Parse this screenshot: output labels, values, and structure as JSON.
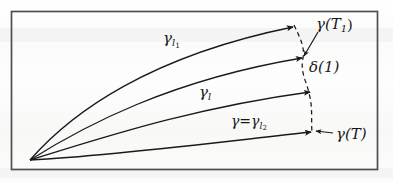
{
  "figure": {
    "type": "geometric-diagram",
    "frame": {
      "color": "#4a4a4e"
    },
    "ink_color": "#1a1a1d",
    "origin": {
      "x": 30,
      "y": 160
    },
    "curves": [
      {
        "name": "gamma-l1",
        "label": "γ",
        "subscript": "l",
        "subsubscript": "1",
        "end": {
          "x": 293,
          "y": 27
        }
      },
      {
        "name": "gamma-second",
        "label": "",
        "end": {
          "x": 303,
          "y": 58
        }
      },
      {
        "name": "gamma-l",
        "label": "γ",
        "subscript": "l",
        "end": {
          "x": 311,
          "y": 92
        }
      },
      {
        "name": "gamma-l2",
        "label": "γ=γ",
        "subscript": "l",
        "subsubscript": "2",
        "end": {
          "x": 312,
          "y": 132
        }
      }
    ],
    "dashed_curve": {
      "name": "delta-curve",
      "from": {
        "x": 293,
        "y": 27
      },
      "to": {
        "x": 312,
        "y": 132
      }
    },
    "labels": {
      "gamma_l1": {
        "base": "γ",
        "sub": "l",
        "subsub": "1"
      },
      "gamma_l": {
        "base": "γ",
        "sub": "l"
      },
      "gamma_eq_gamma_l2": {
        "base": "γ=γ",
        "sub": "l",
        "subsub": "2"
      },
      "gamma_T1": {
        "base": "γ(T",
        "sub": "1",
        "close": ")"
      },
      "delta_1": {
        "text": "δ(1)"
      },
      "gamma_T": {
        "text": "γ(T)"
      }
    },
    "annotation_arrows": [
      {
        "name": "pointer-gamma-T1",
        "from": {
          "x": 318,
          "y": 32
        },
        "to": {
          "x": 303,
          "y": 57
        }
      },
      {
        "name": "pointer-gamma-T",
        "from": {
          "x": 333,
          "y": 133
        },
        "to": {
          "x": 314,
          "y": 132
        }
      }
    ]
  }
}
